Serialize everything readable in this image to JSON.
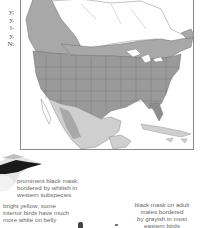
{
  "left_margin_text": {
    "lines": [
      "y;",
      "y,",
      "l-",
      "y,",
      "N:"
    ]
  },
  "map": {
    "title": "Range map of North America",
    "colors": {
      "breeding": "#a8a8a8",
      "year_round": "#8c8c8c",
      "winter": "#cfcfcf",
      "border": "#6f6f6f",
      "background": "#ffffff"
    }
  },
  "illustration": {
    "name": "Common Yellowthroat head (black mask)"
  },
  "captions": {
    "mask": [
      "prominent black mask;",
      "bordered by whitish in",
      "western subspecies"
    ],
    "belly": [
      "bright yellow; some",
      "interior birds have much",
      "more white on belly"
    ],
    "adult": [
      "black mask on adult",
      "males bordered",
      "by grayish in most",
      "eastern birds"
    ]
  }
}
